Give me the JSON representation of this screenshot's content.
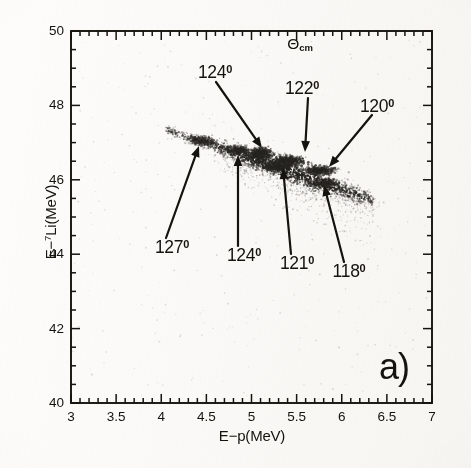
{
  "figure": {
    "panel_label": "a)",
    "header": {
      "symbol": "Θ",
      "subscript": "cm"
    },
    "background_color": "#fbfaf8",
    "ink_color": "#17150f"
  },
  "axes": {
    "x": {
      "label": "E−p(MeV)",
      "min": 3,
      "max": 7,
      "major_step": 0.5,
      "minor_step": 0.1,
      "tick_labels": [
        "3",
        "3.5",
        "4",
        "4.5",
        "5",
        "5.5",
        "6",
        "6.5",
        "7"
      ],
      "tick_values": [
        3,
        3.5,
        4,
        4.5,
        5,
        5.5,
        6,
        6.5,
        7
      ]
    },
    "y": {
      "label_prefix": "E−",
      "label_superscript": "7",
      "label_suffix": "Li(MeV)",
      "label": "E−7Li(MeV)",
      "min": 40,
      "max": 50,
      "major_step": 2,
      "minor_step": 0.5,
      "tick_labels": [
        "40",
        "42",
        "44",
        "46",
        "48",
        "50"
      ],
      "tick_values": [
        40,
        42,
        44,
        46,
        48,
        50
      ]
    }
  },
  "annotations": [
    {
      "label": "124°",
      "text": "124",
      "degree": "0",
      "side": "top",
      "label_x": 215,
      "label_y": 73,
      "tail_x": 216,
      "tail_y": 82,
      "tip_x": 262,
      "tip_y": 148
    },
    {
      "label": "122°",
      "text": "122",
      "degree": "0",
      "side": "top",
      "label_x": 302,
      "label_y": 89,
      "tail_x": 308,
      "tail_y": 98,
      "tip_x": 305,
      "tip_y": 152
    },
    {
      "label": "120°",
      "text": "120",
      "degree": "0",
      "side": "top",
      "label_x": 377,
      "label_y": 107,
      "tail_x": 372,
      "tail_y": 115,
      "tip_x": 329,
      "tip_y": 167
    },
    {
      "label": "127°",
      "text": "127",
      "degree": "0",
      "side": "bottom",
      "label_x": 172,
      "label_y": 248,
      "tail_x": 166,
      "tail_y": 238,
      "tip_x": 199,
      "tip_y": 146
    },
    {
      "label": "124°",
      "text": "124",
      "degree": "0",
      "side": "bottom",
      "label_x": 244,
      "label_y": 256,
      "tail_x": 238,
      "tail_y": 246,
      "tip_x": 238,
      "tip_y": 155
    },
    {
      "label": "121°",
      "text": "121",
      "degree": "0",
      "side": "bottom",
      "label_x": 297,
      "label_y": 264,
      "tail_x": 291,
      "tail_y": 254,
      "tip_x": 283,
      "tip_y": 168
    },
    {
      "label": "118°",
      "text": "118",
      "degree": "0",
      "side": "bottom",
      "label_x": 349,
      "label_y": 272,
      "tail_x": 344,
      "tail_y": 262,
      "tip_x": 324,
      "tip_y": 185
    }
  ],
  "chart_data": {
    "type": "scatter",
    "title": "",
    "subtitle": "",
    "xlabel": "E−p(MeV)",
    "ylabel": "E−7Li(MeV)",
    "xlim": [
      3,
      7
    ],
    "ylim": [
      40,
      50
    ],
    "grid": false,
    "legend": "none",
    "marker_color": "#2a2824",
    "series": [
      {
        "name": "coincidence events",
        "kind": "point-cloud",
        "locus": {
          "x_start": 4.05,
          "y_start": 47.35,
          "x_end": 6.35,
          "y_end": 45.45,
          "spread_y": 0.28,
          "n_points": 4200
        }
      }
    ],
    "clusters": [
      {
        "angle_deg": 127,
        "x": 4.45,
        "y": 47.05,
        "intensity": 0.55,
        "rx": 0.16,
        "ry": 0.13
      },
      {
        "angle_deg": 124,
        "x": 4.85,
        "y": 46.8,
        "intensity": 0.6,
        "rx": 0.15,
        "ry": 0.13
      },
      {
        "angle_deg": 124,
        "x": 5.1,
        "y": 46.7,
        "intensity": 0.95,
        "rx": 0.13,
        "ry": 0.17
      },
      {
        "angle_deg": 122,
        "x": 5.4,
        "y": 46.5,
        "intensity": 1.0,
        "rx": 0.18,
        "ry": 0.15
      },
      {
        "angle_deg": 121,
        "x": 5.3,
        "y": 46.35,
        "intensity": 0.7,
        "rx": 0.16,
        "ry": 0.12
      },
      {
        "angle_deg": 120,
        "x": 5.75,
        "y": 46.25,
        "intensity": 0.85,
        "rx": 0.17,
        "ry": 0.13
      },
      {
        "angle_deg": 118,
        "x": 5.8,
        "y": 45.9,
        "intensity": 0.5,
        "rx": 0.18,
        "ry": 0.14
      }
    ],
    "annotated_angles": [
      124,
      122,
      120,
      127,
      124,
      121,
      118
    ]
  }
}
